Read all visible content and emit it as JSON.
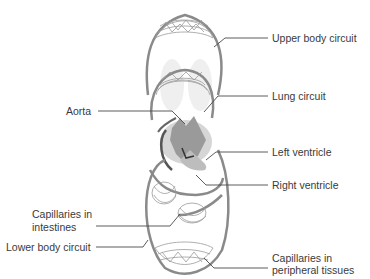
{
  "diagram": {
    "type": "circulatory-system-schematic",
    "labels": {
      "upper_body_circuit": "Upper body circuit",
      "lung_circuit": "Lung circuit",
      "aorta": "Aorta",
      "left_ventricle": "Left ventricle",
      "right_ventricle": "Right ventricle",
      "capillaries_intestines_1": "Capillaries in",
      "capillaries_intestines_2": "intestines",
      "lower_body_circuit": "Lower body circuit",
      "capillaries_peripheral_1": "Capillaries in",
      "capillaries_peripheral_2": "peripheral tissues"
    },
    "colors": {
      "vessel": "#8a8a8a",
      "vessel_dark": "#555555",
      "heart": "#9a9a9a",
      "leader": "#4a4a4a",
      "text": "#3a3a3a"
    }
  }
}
